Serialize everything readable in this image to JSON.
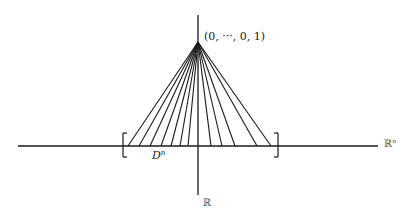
{
  "figure": {
    "apex_label": "(0, ···, 0, 1)",
    "disk_label_base": "D",
    "disk_label_sup": "n",
    "horizontal_axis_label_base": "ℝ",
    "horizontal_axis_label_sup": "n",
    "vertical_axis_label": "ℝ",
    "line_color": "#1a1a1a"
  },
  "geometry": {
    "apex": [
      198,
      42
    ],
    "baseline_y": 146,
    "horizontal_axis": [
      18,
      378
    ],
    "vertical_axis": [
      15,
      195
    ],
    "vertical_axis_x": 198,
    "left_bracket_x": 123,
    "right_bracket_x": 278,
    "bracket_span_y": [
      133,
      157
    ],
    "cone_line_feet_x": [
      128,
      139,
      150,
      161,
      171,
      180,
      188,
      211,
      222,
      235,
      257,
      271
    ]
  }
}
